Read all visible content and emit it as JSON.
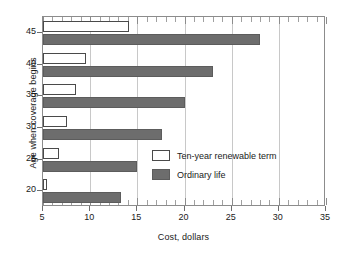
{
  "chart_data": {
    "type": "bar",
    "orientation": "horizontal",
    "title": "",
    "xlabel": "Cost, dollars",
    "ylabel": "Age when coverage begins",
    "categories": [
      "20",
      "25",
      "30",
      "35",
      "40",
      "45"
    ],
    "xlim": [
      5,
      35
    ],
    "ylim": [
      17.5,
      47.5
    ],
    "xticks": [
      5,
      10,
      15,
      20,
      25,
      30,
      35
    ],
    "xticklabels": [
      "5",
      "10",
      "15",
      "20",
      "25",
      "30",
      "35"
    ],
    "yticks": [
      20,
      25,
      30,
      35,
      40,
      45
    ],
    "yticklabels": [
      "20",
      "25",
      "30",
      "35",
      "40",
      "45"
    ],
    "minor_ticks_per_interval": 5,
    "grid": "vertical-major",
    "legend_position": "center-right-inside",
    "series": [
      {
        "name": "Ten-year renewable term",
        "color": "#ffffff",
        "edgecolor": "#4a4a4a",
        "values": [
          5.4,
          6.7,
          7.5,
          8.5,
          9.6,
          14.1
        ]
      },
      {
        "name": "Ordinary life",
        "color": "#6d6d6d",
        "edgecolor": "#5c5c5c",
        "values": [
          13.3,
          15.0,
          17.6,
          20.0,
          23.0,
          28.0
        ]
      }
    ]
  },
  "legend": {
    "items": [
      {
        "label": "Ten-year renewable term",
        "swatch": "term"
      },
      {
        "label": "Ordinary life",
        "swatch": "ordinary"
      }
    ]
  },
  "axes": {
    "x_title": "Cost, dollars",
    "y_title": "Age when coverage begins"
  }
}
